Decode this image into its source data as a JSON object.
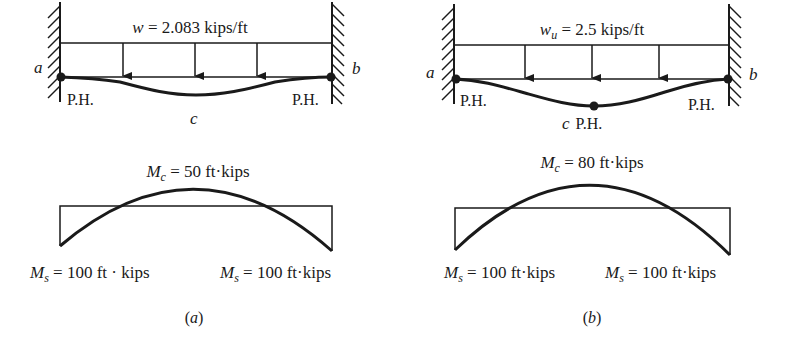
{
  "figure": {
    "panels": [
      {
        "id": "a",
        "caption": "(a)",
        "load_label": {
          "symbol": "w",
          "subscript": "",
          "value_text": " = 2.083 kips/ft"
        },
        "support_left_label": "a",
        "support_right_label": "b",
        "hinge_left_label": "P.H.",
        "hinge_right_label": "P.H.",
        "midspan_label": "c",
        "midspan_hinge_label": "",
        "moment_center": {
          "symbol": "M",
          "subscript": "c",
          "value_text": " = 50 ft·kips"
        },
        "moment_left": {
          "symbol": "M",
          "subscript": "s",
          "value_text": " = 100 ft · kips"
        },
        "moment_right": {
          "symbol": "M",
          "subscript": "s",
          "value_text": " = 100 ft·kips"
        }
      },
      {
        "id": "b",
        "caption": "(b)",
        "load_label": {
          "symbol": "w",
          "subscript": "u",
          "value_text": " = 2.5 kips/ft"
        },
        "support_left_label": "a",
        "support_right_label": "b",
        "hinge_left_label": "P.H.",
        "hinge_right_label": "P.H.",
        "midspan_label": "c",
        "midspan_hinge_label": "P.H.",
        "moment_center": {
          "symbol": "M",
          "subscript": "c",
          "value_text": " = 80 ft·kips"
        },
        "moment_left": {
          "symbol": "M",
          "subscript": "s",
          "value_text": " = 100 ft·kips"
        },
        "moment_right": {
          "symbol": "M",
          "subscript": "s",
          "value_text": " = 100 ft·kips"
        }
      }
    ]
  }
}
